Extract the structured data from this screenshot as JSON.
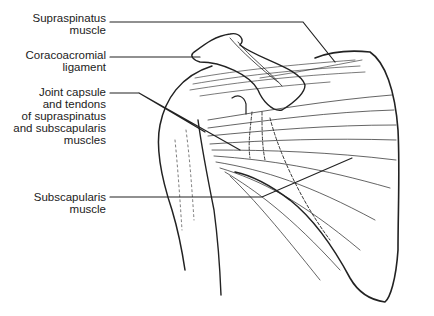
{
  "figure": {
    "labels": [
      {
        "id": "supraspinatus",
        "lines": [
          "Supraspinatus",
          "muscle"
        ]
      },
      {
        "id": "coracoacromial",
        "lines": [
          "Coracoacromial",
          "ligament"
        ]
      },
      {
        "id": "joint-capsule",
        "lines": [
          "Joint capsule",
          "and tendons",
          "of supraspinatus",
          "and subscapularis",
          "muscles"
        ]
      },
      {
        "id": "subscapularis",
        "lines": [
          "Subscapularis",
          "muscle"
        ]
      }
    ]
  }
}
